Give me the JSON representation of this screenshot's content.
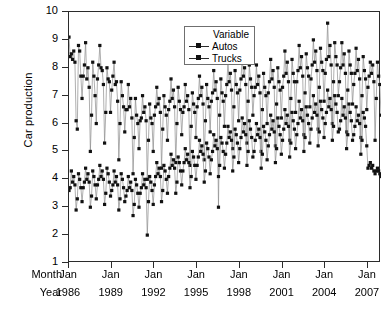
{
  "chart_data": {
    "type": "line",
    "title": "",
    "xlabel": "",
    "ylabel": "Car production",
    "ylim": [
      1,
      10
    ],
    "yticks": [
      1,
      2,
      3,
      4,
      5,
      6,
      7,
      8,
      9,
      10
    ],
    "grid": false,
    "legend_position": "top-left-inside",
    "legend_title": "Variable",
    "x_axis_rows": [
      {
        "label": "Month",
        "values": [
          "Jan",
          "Jan",
          "Jan",
          "Jan",
          "Jan",
          "Jan",
          "Jan",
          "Jan"
        ]
      },
      {
        "label": "Year",
        "values": [
          "1986",
          "1989",
          "1992",
          "1995",
          "1998",
          "2001",
          "2004",
          "2007"
        ]
      }
    ],
    "x_start_year": 1986,
    "x_end_year": 2007,
    "x_interval": "monthly",
    "series": [
      {
        "name": "Autos",
        "marker": "filled-square",
        "color": "#111111",
        "values": [
          9.1,
          8.4,
          8.5,
          8.3,
          8.6,
          8.2,
          6.1,
          5.8,
          8.8,
          8.6,
          7.7,
          6.9,
          7.7,
          8.1,
          8.9,
          7.6,
          8.0,
          7.3,
          5.0,
          6.3,
          8.2,
          7.7,
          7.0,
          6.0,
          7.6,
          8.1,
          8.8,
          8.0,
          7.9,
          7.4,
          5.3,
          6.4,
          8.0,
          7.6,
          7.5,
          6.4,
          7.2,
          7.7,
          8.2,
          7.4,
          7.5,
          6.8,
          4.7,
          6.0,
          7.5,
          7.0,
          6.6,
          5.7,
          6.5,
          6.5,
          7.4,
          6.6,
          6.9,
          6.2,
          4.2,
          5.5,
          6.9,
          6.3,
          6.0,
          5.1,
          6.1,
          6.2,
          7.0,
          6.4,
          6.6,
          6.1,
          4.0,
          5.4,
          6.7,
          6.2,
          6.0,
          5.0,
          6.3,
          6.6,
          7.3,
          6.7,
          6.9,
          6.4,
          4.4,
          5.8,
          7.0,
          6.6,
          6.3,
          5.4,
          6.5,
          6.8,
          7.6,
          6.9,
          7.2,
          6.6,
          4.6,
          6.0,
          7.3,
          6.8,
          6.5,
          5.6,
          6.4,
          6.6,
          7.4,
          6.8,
          7.0,
          6.5,
          4.5,
          5.9,
          7.1,
          6.7,
          6.4,
          5.5,
          6.6,
          6.9,
          7.7,
          7.0,
          7.3,
          6.7,
          4.7,
          6.1,
          7.4,
          6.9,
          6.6,
          5.7,
          6.8,
          7.1,
          7.9,
          7.2,
          7.5,
          6.9,
          3.0,
          6.3,
          7.6,
          7.1,
          6.8,
          5.9,
          7.0,
          7.4,
          8.2,
          7.5,
          7.8,
          7.2,
          5.1,
          6.6,
          7.9,
          7.4,
          7.1,
          6.1,
          7.2,
          7.6,
          8.4,
          7.7,
          8.0,
          7.4,
          5.3,
          6.8,
          8.1,
          7.6,
          7.3,
          6.3,
          7.0,
          7.3,
          8.1,
          7.4,
          7.7,
          7.1,
          5.0,
          6.5,
          7.8,
          7.3,
          7.0,
          6.0,
          7.1,
          7.5,
          8.3,
          7.6,
          7.9,
          7.3,
          5.2,
          6.7,
          8.0,
          7.5,
          7.2,
          6.2,
          7.3,
          7.7,
          8.6,
          7.8,
          8.2,
          7.5,
          5.4,
          6.9,
          8.3,
          7.8,
          7.5,
          6.4,
          7.5,
          7.9,
          8.8,
          8.0,
          8.4,
          7.7,
          5.6,
          7.1,
          8.5,
          8.0,
          7.7,
          6.6,
          7.6,
          8.1,
          9.0,
          8.2,
          8.6,
          7.9,
          5.8,
          7.3,
          8.7,
          8.2,
          7.9,
          6.8,
          7.8,
          8.3,
          9.6,
          8.4,
          8.8,
          8.1,
          6.0,
          7.5,
          8.9,
          8.4,
          8.1,
          7.0,
          7.5,
          8.0,
          8.9,
          8.1,
          8.5,
          7.8,
          5.7,
          7.2,
          8.6,
          8.1,
          7.8,
          6.7,
          7.4,
          7.8,
          8.7,
          7.9,
          8.3,
          7.6,
          5.5,
          7.0,
          8.4,
          7.9,
          7.6,
          6.5,
          7.3,
          7.7,
          8.2,
          7.8,
          8.1,
          7.5,
          5.4,
          6.9,
          8.2,
          7.7,
          7.4,
          6.3
        ]
      },
      {
        "name": "Trucks",
        "marker": "filled-square",
        "color": "#111111",
        "values": [
          3.6,
          3.7,
          4.3,
          3.9,
          4.1,
          3.8,
          2.9,
          3.3,
          4.2,
          4.0,
          3.7,
          3.2,
          3.7,
          3.9,
          4.4,
          4.0,
          4.2,
          3.9,
          3.0,
          3.4,
          4.3,
          4.1,
          3.8,
          3.3,
          3.8,
          4.0,
          4.5,
          4.1,
          4.3,
          4.0,
          3.1,
          3.5,
          4.4,
          4.2,
          3.9,
          3.4,
          3.6,
          3.8,
          4.3,
          3.9,
          4.1,
          3.8,
          2.9,
          3.3,
          4.2,
          4.0,
          3.7,
          3.2,
          3.4,
          3.6,
          4.1,
          3.7,
          3.9,
          3.6,
          2.7,
          3.1,
          4.0,
          3.8,
          3.5,
          3.0,
          3.5,
          3.7,
          4.2,
          3.8,
          4.0,
          3.7,
          2.0,
          3.2,
          4.1,
          3.9,
          3.6,
          3.1,
          3.8,
          4.1,
          4.6,
          4.2,
          4.4,
          4.1,
          3.2,
          3.6,
          4.5,
          4.3,
          4.0,
          3.5,
          4.1,
          4.4,
          4.9,
          4.5,
          4.7,
          4.4,
          3.5,
          3.9,
          4.8,
          4.6,
          4.3,
          3.8,
          4.3,
          4.6,
          5.1,
          4.7,
          4.9,
          4.6,
          3.7,
          4.1,
          5.0,
          4.8,
          4.5,
          4.0,
          4.5,
          4.8,
          5.4,
          5.0,
          5.2,
          4.9,
          3.9,
          4.3,
          5.3,
          5.1,
          4.8,
          4.2,
          4.7,
          5.0,
          5.6,
          5.2,
          5.4,
          5.1,
          4.1,
          4.5,
          5.5,
          5.3,
          5.0,
          4.4,
          4.9,
          5.3,
          5.9,
          5.5,
          5.7,
          5.4,
          4.3,
          4.8,
          5.8,
          5.6,
          5.3,
          4.6,
          5.1,
          5.5,
          6.2,
          5.7,
          6.0,
          5.6,
          4.5,
          5.0,
          6.1,
          5.8,
          5.5,
          4.8,
          5.0,
          5.4,
          6.0,
          5.6,
          5.8,
          5.5,
          4.4,
          4.9,
          5.9,
          5.7,
          5.4,
          4.7,
          5.2,
          5.6,
          6.3,
          5.8,
          6.1,
          5.7,
          4.6,
          5.1,
          6.2,
          5.9,
          5.6,
          4.9,
          5.4,
          5.8,
          6.5,
          6.0,
          6.3,
          5.9,
          4.8,
          5.3,
          6.4,
          6.1,
          5.8,
          5.1,
          5.6,
          6.0,
          6.8,
          6.2,
          6.5,
          6.1,
          5.0,
          5.5,
          6.6,
          6.3,
          6.0,
          5.3,
          5.8,
          6.2,
          7.0,
          6.4,
          6.7,
          6.3,
          5.2,
          5.7,
          6.8,
          6.5,
          6.2,
          5.5,
          6.0,
          6.4,
          7.2,
          6.6,
          6.9,
          6.5,
          5.4,
          5.9,
          7.0,
          6.7,
          6.4,
          5.7,
          5.8,
          6.1,
          6.9,
          6.3,
          6.6,
          6.2,
          5.1,
          5.6,
          6.7,
          6.4,
          6.1,
          5.4,
          5.6,
          5.9,
          6.6,
          6.1,
          6.3,
          6.0,
          4.9,
          5.4,
          6.4,
          6.2,
          5.9,
          5.2,
          4.4,
          4.5,
          4.6,
          4.4,
          4.5,
          4.3,
          4.2,
          4.3,
          4.4,
          4.3,
          4.2,
          4.1
        ]
      }
    ]
  }
}
